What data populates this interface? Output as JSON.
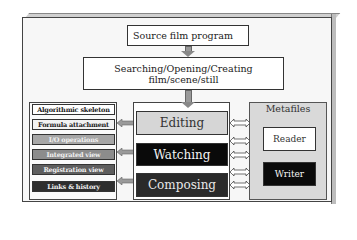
{
  "diagram": {
    "top": {
      "source_label": "Source film program",
      "search_label_line1": "Searching/Opening/Creating",
      "search_label_line2": "film/scene/still"
    },
    "left_panel": {
      "items": [
        {
          "label": "Algorithmic skeleton",
          "bg": "#ffffff",
          "fg": "#222222"
        },
        {
          "label": "Formula attachment",
          "bg": "#f2f2f2",
          "fg": "#222222"
        },
        {
          "label": "I/O operations",
          "bg": "#a6a6a6",
          "fg": "#f0f0f0"
        },
        {
          "label": "Integrated view",
          "bg": "#8c8c8c",
          "fg": "#f0f0f0"
        },
        {
          "label": "Registration view",
          "bg": "#5e5e5e",
          "fg": "#f0f0f0"
        },
        {
          "label": "Links & history",
          "bg": "#2e2e2e",
          "fg": "#f0f0f0"
        }
      ]
    },
    "middle_panel": {
      "modes": [
        {
          "label": "Editing",
          "bg": "#d6d6d6",
          "fg": "#333333"
        },
        {
          "label": "Watching",
          "bg": "#0a0a0a",
          "fg": "#f5f5f5"
        },
        {
          "label": "Composing",
          "bg": "#2a2a2a",
          "fg": "#e8e8e8"
        }
      ]
    },
    "right_panel": {
      "title": "Metafiles",
      "reader_label": "Reader",
      "writer_label": "Writer"
    }
  }
}
